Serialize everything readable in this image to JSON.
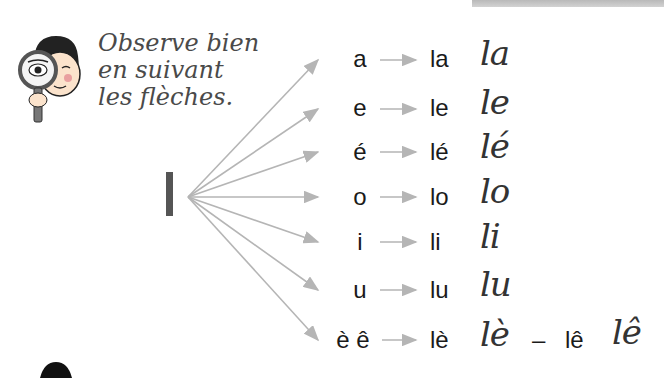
{
  "instruction": {
    "lines": [
      "Observe bien",
      "en suivant",
      "les flèches."
    ]
  },
  "mascot_icon": "boy-with-magnifying-glass-icon",
  "source_letter": "l",
  "rows": [
    {
      "vowel": "a",
      "syllable": "la",
      "cursive": "la"
    },
    {
      "vowel": "e",
      "syllable": "le",
      "cursive": "le"
    },
    {
      "vowel": "é",
      "syllable": "lé",
      "cursive": "lé"
    },
    {
      "vowel": "o",
      "syllable": "lo",
      "cursive": "lo"
    },
    {
      "vowel": "i",
      "syllable": "li",
      "cursive": "li"
    },
    {
      "vowel": "u",
      "syllable": "lu",
      "cursive": "lu"
    },
    {
      "vowel": "è ê",
      "syllable": "lè",
      "cursive": "lè",
      "dash": "–",
      "syllable2": "lê",
      "cursive2": "lê"
    }
  ],
  "colors": {
    "arrow": "#b5b5b5",
    "text": "#1a1a1a",
    "instruction": "#4a4a4a"
  }
}
